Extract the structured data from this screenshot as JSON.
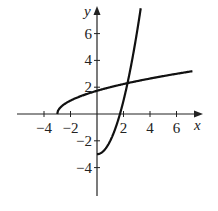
{
  "chart_data": {
    "type": "line",
    "title": "",
    "xlabel": "x",
    "ylabel": "y",
    "xlim": [
      -5.5,
      7.5
    ],
    "ylim": [
      -6,
      8
    ],
    "grid": false,
    "x_ticks": [
      -4,
      -2,
      2,
      4,
      6
    ],
    "x_tick_labels": [
      "−4",
      "−2",
      "2",
      "4",
      "6"
    ],
    "y_ticks": [
      6,
      4,
      2,
      -2,
      -4
    ],
    "y_tick_labels": [
      "6",
      "4",
      "2",
      "−2",
      "−4"
    ],
    "series": [
      {
        "name": "y = sqrt(x + 3)",
        "x": [
          -3,
          -2.5,
          -2,
          -1,
          0,
          1,
          2,
          2.3,
          3,
          4,
          5,
          6,
          7
        ],
        "values": [
          0,
          0.71,
          1,
          1.41,
          1.73,
          2,
          2.24,
          2.3,
          2.45,
          2.65,
          2.83,
          3,
          3.16
        ]
      },
      {
        "name": "y = x^2 - 3, x >= 0",
        "x": [
          0,
          0.5,
          1,
          1.5,
          1.73,
          2,
          2.3,
          2.5,
          3,
          3.3
        ],
        "values": [
          -3,
          -2.75,
          -2,
          -0.75,
          0,
          1,
          2.29,
          3.25,
          6,
          7.89
        ]
      }
    ],
    "annotations": [
      "Curves intersect near (2.3, 2.3)"
    ]
  }
}
